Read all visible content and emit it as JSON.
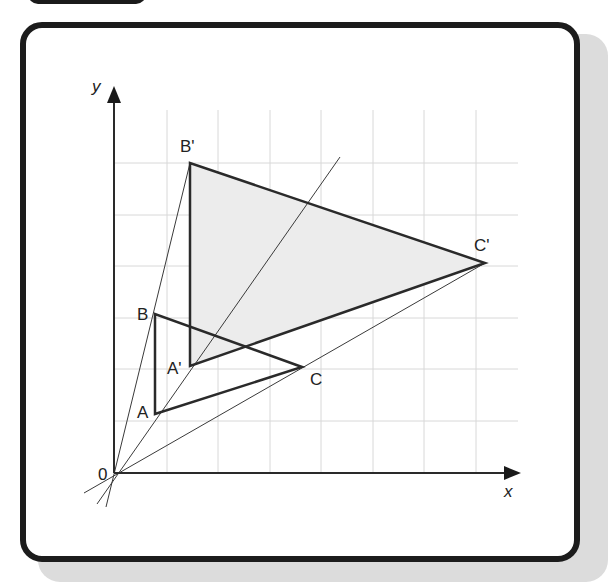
{
  "figure": {
    "type": "enlargement-diagram",
    "axes": {
      "x_label": "x",
      "y_label": "y",
      "origin_label": "0"
    },
    "grid": {
      "columns": 8,
      "rows": 6,
      "color": "#d8d8d8"
    },
    "colors": {
      "frame": "#1c1c1c",
      "image_fill": "#ececec",
      "lines": "#2a2a2a",
      "shadow": "#dcdcdc"
    },
    "points": {
      "A": {
        "label": "A"
      },
      "B": {
        "label": "B"
      },
      "C": {
        "label": "C"
      },
      "A_prime": {
        "label": "A'"
      },
      "B_prime": {
        "label": "B'"
      },
      "C_prime": {
        "label": "C'"
      }
    }
  }
}
